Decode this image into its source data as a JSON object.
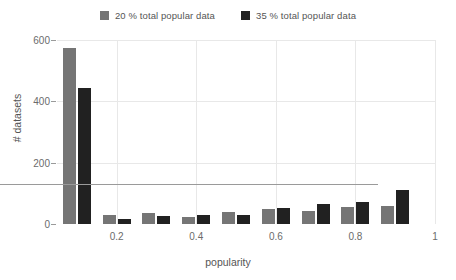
{
  "chart_data": {
    "type": "bar",
    "title": "",
    "xlabel": "popularity",
    "ylabel": "# datasets",
    "categories": [
      "0.1",
      "0.2",
      "0.3",
      "0.4",
      "0.5",
      "0.6",
      "0.7",
      "0.8",
      "0.9"
    ],
    "x": [
      0.1,
      0.2,
      0.3,
      0.4,
      0.5,
      0.6,
      0.7,
      0.8,
      0.9
    ],
    "series": [
      {
        "name": "20 % total popular data",
        "color": "#757575",
        "values": [
          575,
          31,
          35,
          24,
          38,
          48,
          44,
          55,
          58
        ]
      },
      {
        "name": "35 % total popular data",
        "color": "#212121",
        "values": [
          443,
          16,
          26,
          29,
          30,
          52,
          65,
          72,
          110
        ]
      }
    ],
    "ylim": [
      0,
      600
    ],
    "xlim": [
      0.05,
      1.0
    ],
    "yticks": [
      0,
      200,
      400,
      600
    ],
    "ytick_labels": [
      "0",
      "200",
      "400",
      "600"
    ],
    "xticks": [
      0.2,
      0.4,
      0.6,
      0.8,
      1
    ],
    "xtick_labels": [
      "0.2",
      "0.4",
      "0.6",
      "0.8",
      "1"
    ],
    "grid": "horizontal-and-vertical-light",
    "legend_position": "top-center",
    "background": "#ffffff",
    "gridline_color": "#e8e8e8",
    "axis_color": "#9a9a9a",
    "text_color": "#555555"
  }
}
